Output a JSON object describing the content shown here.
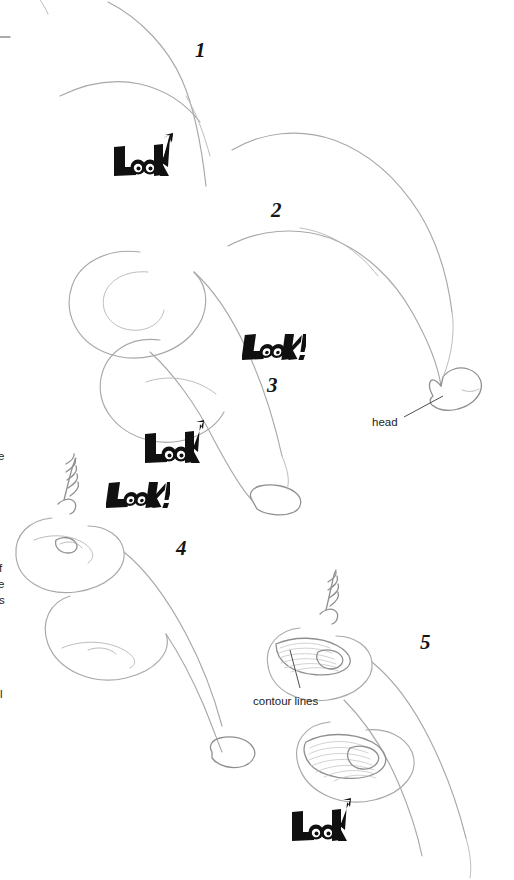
{
  "page": {
    "background_color": "#ffffff",
    "ink_color": "#9a9a9a",
    "dark_ink_color": "#555555",
    "text_color": "#1b1b1b",
    "width": 514,
    "height": 880
  },
  "steps": [
    {
      "number": "1",
      "x": 195,
      "y": 38
    },
    {
      "number": "2",
      "x": 271,
      "y": 198
    },
    {
      "number": "3",
      "x": 267,
      "y": 373
    },
    {
      "number": "4",
      "x": 176,
      "y": 536
    },
    {
      "number": "5",
      "x": 420,
      "y": 630
    }
  ],
  "callouts": [
    {
      "label": "head",
      "label_x": 372,
      "label_y": 416,
      "leader": {
        "x1": 404,
        "y1": 417,
        "x2": 443,
        "y2": 396
      }
    },
    {
      "label": "contour lines",
      "label_x": 253,
      "label_y": 695,
      "leader": {
        "x1": 300,
        "y1": 688,
        "x2": 290,
        "y2": 650
      }
    }
  ],
  "margin_fragments": [
    {
      "text": "e",
      "x": -2,
      "y": 450
    },
    {
      "text": "f",
      "x": -1,
      "y": 562
    },
    {
      "text": "e",
      "x": -2,
      "y": 578
    },
    {
      "text": "s",
      "x": -1,
      "y": 594
    },
    {
      "text": "l",
      "x": 0,
      "y": 688
    }
  ],
  "watermarks": [
    {
      "variant": "arrow",
      "text": "Look",
      "x": 112,
      "y": 133,
      "scale": 1.0
    },
    {
      "variant": "excl",
      "text": "Look!",
      "x": 242,
      "y": 334,
      "scale": 1.0
    },
    {
      "variant": "arrow",
      "text": "Look",
      "x": 143,
      "y": 420,
      "scale": 1.0
    },
    {
      "variant": "excl",
      "text": "Look!",
      "x": 106,
      "y": 482,
      "scale": 1.0
    },
    {
      "variant": "arrow",
      "text": "Look",
      "x": 290,
      "y": 798,
      "scale": 1.0
    }
  ]
}
